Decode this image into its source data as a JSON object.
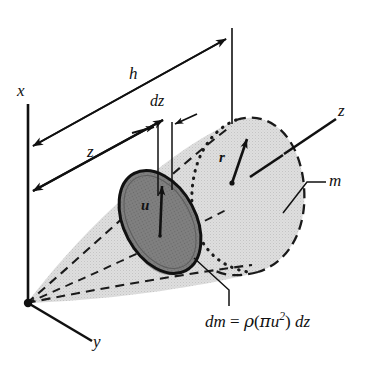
{
  "figure": {
    "kind": "engineering-mechanics-diagram",
    "background_color": "#ffffff",
    "ink_color": "#111111",
    "cone_fill_color": "#d9d9d9",
    "disk_fill_color": "#7a7a7a",
    "disk_edge_color": "#1a1a1a"
  },
  "axes": {
    "x_label": "x",
    "y_label": "y",
    "z_label": "z",
    "origin_marker": "origin-dot"
  },
  "dimensions": {
    "height_label": "h",
    "distance_label": "z",
    "thickness_label": "dz"
  },
  "radii": {
    "element_radius_label": "u",
    "base_radius_label": "r"
  },
  "body": {
    "mass_label": "m"
  },
  "formula": {
    "lhs": "dm",
    "equals": "=",
    "density": "ρ",
    "open_paren": "(",
    "pi": "π",
    "u": "u",
    "exponent": "2",
    "close_paren": ")",
    "dz": "dz",
    "plain_text": "dm = ρ(πu²) dz"
  },
  "icons": {
    "arrowhead": "arrowhead-icon",
    "origin_dot": "origin-dot-icon"
  }
}
